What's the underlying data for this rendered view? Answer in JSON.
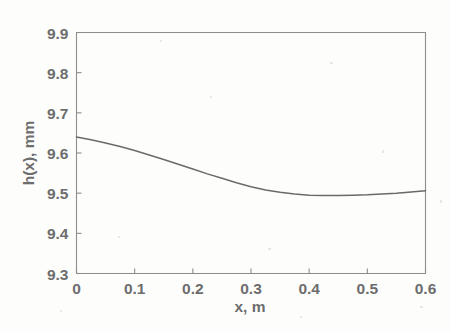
{
  "chart_data": {
    "type": "line",
    "title": "",
    "xlabel": "x, m",
    "ylabel": "h(x), mm",
    "xlim": [
      0,
      0.6
    ],
    "ylim": [
      9.3,
      9.9
    ],
    "grid": false,
    "legend": null,
    "xticks": [
      "0",
      "0.1",
      "0.2",
      "0.3",
      "0.4",
      "0.5",
      "0.6"
    ],
    "xtick_values": [
      0,
      0.1,
      0.2,
      0.3,
      0.4,
      0.5,
      0.6
    ],
    "yticks": [
      "9.3",
      "9.4",
      "9.5",
      "9.6",
      "9.7",
      "9.8",
      "9.9"
    ],
    "ytick_values": [
      9.3,
      9.4,
      9.5,
      9.6,
      9.7,
      9.8,
      9.9
    ],
    "series": [
      {
        "name": "h(x)",
        "color": "#6a6a6a",
        "x": [
          0.0,
          0.025,
          0.05,
          0.075,
          0.1,
          0.125,
          0.15,
          0.175,
          0.2,
          0.225,
          0.25,
          0.275,
          0.3,
          0.325,
          0.35,
          0.375,
          0.4,
          0.425,
          0.45,
          0.475,
          0.5,
          0.525,
          0.55,
          0.575,
          0.6
        ],
        "y": [
          9.64,
          9.633,
          9.625,
          9.616,
          9.606,
          9.595,
          9.584,
          9.572,
          9.56,
          9.548,
          9.537,
          9.526,
          9.516,
          9.508,
          9.502,
          9.498,
          9.495,
          9.494,
          9.494,
          9.495,
          9.496,
          9.498,
          9.5,
          9.503,
          9.506
        ]
      }
    ]
  },
  "axes": {
    "x_axis_label": "x, m",
    "y_axis_label": "h(x), mm"
  }
}
